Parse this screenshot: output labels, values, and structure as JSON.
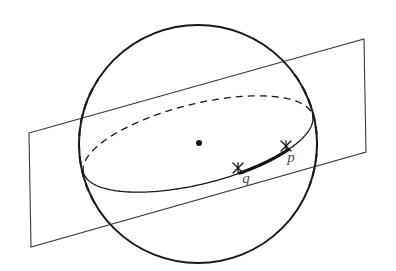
{
  "figure": {
    "background_color": "#ffffff",
    "stroke_color": "#1a1a1a",
    "plane_stroke_color": "#3a3a3a",
    "label_color": "#4d4d4d",
    "width": 396,
    "height": 271
  },
  "sphere": {
    "name": "sphere-outline",
    "center": {
      "x": 198,
      "y": 144
    },
    "radius_x": 119,
    "radius_y": 119,
    "stroke_width": 2.0,
    "style": "solid"
  },
  "center_point": {
    "name": "sphere-center-dot",
    "x": 199,
    "y": 143,
    "radius": 3.0,
    "fill": "#111111"
  },
  "great_circle": {
    "name": "great-circle-ellipse",
    "center": {
      "x": 198,
      "y": 144
    },
    "semi_major": 118,
    "semi_minor": 40,
    "rotation_deg": -14,
    "front_style": "solid",
    "back_style": "dashed",
    "dash_pattern": "7,5",
    "stroke_width": 1.3
  },
  "plane": {
    "name": "cutting-plane",
    "shape": "parallelogram",
    "corners": [
      {
        "label": "top-left",
        "x": 29,
        "y": 133
      },
      {
        "label": "top-right",
        "x": 364,
        "y": 39
      },
      {
        "label": "bottom-right",
        "x": 366,
        "y": 152
      },
      {
        "label": "bottom-left",
        "x": 31,
        "y": 247
      }
    ],
    "fill": "none",
    "stroke_width": 1.1
  },
  "arc_pq": {
    "name": "highlighted-arc-pq",
    "description": "thick arc segment of the great circle between q and p",
    "stroke_width": 3.2,
    "from": "q",
    "to": "p"
  },
  "points": [
    {
      "name": "point-p",
      "label": "p",
      "marker": "cross-marker",
      "marker_x": 286,
      "marker_y": 146,
      "marker_size": 5,
      "label_x": 291,
      "label_y": 162
    },
    {
      "name": "point-q",
      "label": "q",
      "marker": "cross-marker",
      "marker_x": 238,
      "marker_y": 168,
      "marker_size": 5,
      "label_x": 246,
      "label_y": 183
    }
  ]
}
